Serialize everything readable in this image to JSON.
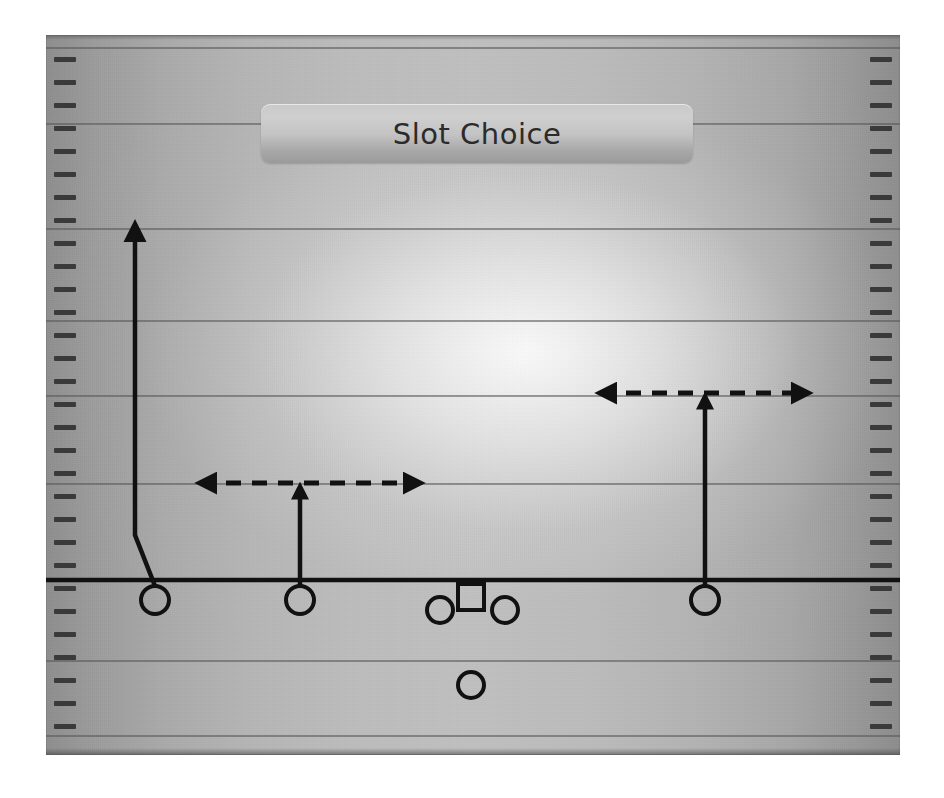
{
  "title": {
    "label": "Slot Choice"
  },
  "caption": {
    "text": ""
  },
  "colors": {
    "line": "#111111",
    "yardline": "#585858",
    "hash": "#3a3a3a",
    "banner_text": "#2b2b2b",
    "field_light": "#c0c0c0",
    "field_dark": "#8d8d8d"
  },
  "field": {
    "left": 46,
    "top": 35,
    "width": 854,
    "height": 720,
    "yardline_y": [
      47,
      123,
      228,
      320,
      395,
      483,
      580,
      660,
      735
    ],
    "hash_spacing": 23,
    "line_of_scrimmage_y": 580
  },
  "chart_data": {
    "type": "diagram",
    "title": "Slot Choice",
    "subtitle": "",
    "xlabel": "",
    "ylabel": "",
    "players": [
      {
        "id": "X",
        "label": "",
        "shape": "circle",
        "x": 155,
        "y": 600,
        "radius": 14,
        "role": "wide-receiver-left"
      },
      {
        "id": "S",
        "label": "",
        "shape": "circle",
        "x": 300,
        "y": 600,
        "radius": 14,
        "role": "slot-receiver-left"
      },
      {
        "id": "LG",
        "label": "",
        "shape": "circle",
        "x": 440,
        "y": 610,
        "radius": 13,
        "role": "lineman-left"
      },
      {
        "id": "QB",
        "label": "",
        "shape": "square",
        "x": 471,
        "y": 597,
        "size": 26,
        "role": "quarterback"
      },
      {
        "id": "RG",
        "label": "",
        "shape": "circle",
        "x": 505,
        "y": 610,
        "radius": 13,
        "role": "lineman-right"
      },
      {
        "id": "RB",
        "label": "",
        "shape": "circle",
        "x": 471,
        "y": 685,
        "radius": 13,
        "role": "running-back"
      },
      {
        "id": "Z",
        "label": "",
        "shape": "circle",
        "x": 705,
        "y": 600,
        "radius": 14,
        "role": "wide-receiver-right"
      }
    ],
    "routes": [
      {
        "player": "X",
        "name": "go-route",
        "style": "solid",
        "points": [
          [
            155,
            586
          ],
          [
            135,
            535
          ],
          [
            135,
            226
          ]
        ],
        "arrowhead": "up"
      },
      {
        "player": "S",
        "name": "slot-choice-stem",
        "style": "solid",
        "points": [
          [
            300,
            586
          ],
          [
            300,
            487
          ]
        ],
        "arrowhead": "up-small"
      },
      {
        "player": "S",
        "name": "slot-choice-option",
        "style": "dashed",
        "points": [
          [
            200,
            483
          ],
          [
            420,
            483
          ]
        ],
        "arrowhead": "both"
      },
      {
        "player": "Z",
        "name": "slot-choice-stem",
        "style": "solid",
        "points": [
          [
            705,
            586
          ],
          [
            705,
            397
          ]
        ],
        "arrowhead": "up-small"
      },
      {
        "player": "Z",
        "name": "slot-choice-option",
        "style": "dashed",
        "points": [
          [
            600,
            393
          ],
          [
            808,
            393
          ]
        ],
        "arrowhead": "both"
      }
    ],
    "scrimmage_line": {
      "y": 580,
      "x1": 46,
      "x2": 900,
      "style": "solid"
    },
    "legend": [],
    "annotations": []
  }
}
